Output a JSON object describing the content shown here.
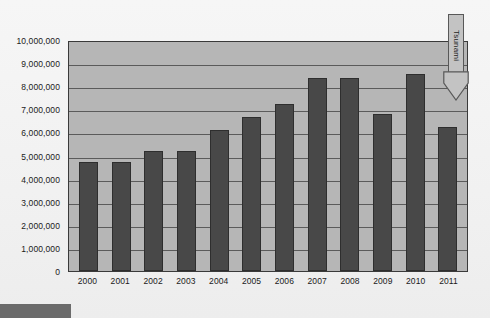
{
  "chart_data": {
    "type": "bar",
    "title": "",
    "subtitle": "",
    "xlabel": "",
    "ylabel": "",
    "categories": [
      "2000",
      "2001",
      "2002",
      "2003",
      "2004",
      "2005",
      "2006",
      "2007",
      "2008",
      "2009",
      "2010",
      "2011"
    ],
    "values": [
      4700000,
      4700000,
      5200000,
      5200000,
      6100000,
      6670000,
      7250000,
      8350000,
      8350000,
      6800000,
      8550000,
      6250000
    ],
    "series": [
      {
        "name": "",
        "values": [
          4700000,
          4700000,
          5200000,
          5200000,
          6100000,
          6670000,
          7250000,
          8350000,
          8350000,
          6800000,
          8550000,
          6250000
        ]
      }
    ],
    "ylim": [
      0,
      10000000
    ],
    "ytick_values": [
      0,
      1000000,
      2000000,
      3000000,
      4000000,
      5000000,
      6000000,
      7000000,
      8000000,
      9000000,
      10000000
    ],
    "ytick_labels": [
      "0",
      "1,000,000",
      "2,000,000",
      "3,000,000",
      "4,000,000",
      "5,000,000",
      "6,000,000",
      "7,000,000",
      "8,000,000",
      "9,000,000",
      "10,000,000"
    ],
    "grid": true,
    "legend": false,
    "legend_position": "none",
    "annotations": [
      {
        "text": "Tsunami",
        "shape": "down-arrow",
        "target_category": "2011",
        "orientation": "vertical"
      }
    ],
    "colors": {
      "bar_fill": "#484848",
      "bar_border": "#2e2e2e",
      "plot_background": "#b6b6b6",
      "plot_border": "#3a3a3a",
      "gridline": "#5b5b5b",
      "page_background": "#f2f2f2",
      "annotation_fill": "#c3c3c3",
      "annotation_border": "#585858",
      "footer_strip": "#6b6b6b",
      "text": "#1a1a1a"
    }
  }
}
